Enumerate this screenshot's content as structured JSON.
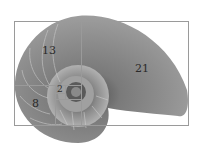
{
  "image": {
    "subject": "nautilus shell cross-section with Fibonacci rectangles overlay",
    "labels": [
      {
        "text": "13",
        "x": 42,
        "y": 45
      },
      {
        "text": "21",
        "x": 135,
        "y": 63
      },
      {
        "text": "8",
        "x": 32,
        "y": 98
      },
      {
        "text": "2",
        "x": 57,
        "y": 84
      }
    ],
    "colors": {
      "shell_dark": "#5a5a5a",
      "shell_mid": "#8c8c8c",
      "shell_light": "#c8c8c8",
      "grid_line": "#9a9a9a"
    }
  }
}
